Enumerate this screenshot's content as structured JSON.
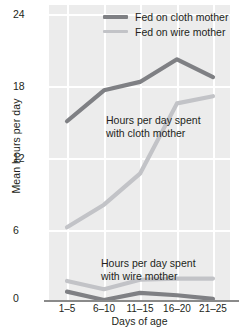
{
  "chart_data": {
    "type": "line",
    "title": "",
    "xlabel": "Days of age",
    "ylabel": "Mean hours per day",
    "categories": [
      "1–5",
      "6–10",
      "11–15",
      "16–20",
      "21–25"
    ],
    "ylim": [
      0,
      24
    ],
    "yticks": [
      0,
      6,
      12,
      18,
      24
    ],
    "ytick_labels": [
      "0",
      "6",
      "12",
      "18",
      "24"
    ],
    "grid": true,
    "legend_position": "top-right",
    "series": [
      {
        "name": "Fed on cloth mother",
        "measure": "hours per day spent with cloth mother",
        "color": "#7f8084",
        "values": [
          15.0,
          17.6,
          18.3,
          20.2,
          18.7
        ]
      },
      {
        "name": "Fed on wire mother",
        "measure": "hours per day spent with cloth mother",
        "color": "#c2c3c7",
        "values": [
          6.1,
          8.0,
          10.6,
          16.5,
          17.1
        ]
      },
      {
        "name": "Fed on cloth mother",
        "measure": "hours per day spent with wire mother",
        "color": "#7f8084",
        "values": [
          0.7,
          0.0,
          0.6,
          0.4,
          0.1
        ]
      },
      {
        "name": "Fed on wire mother",
        "measure": "hours per day spent with wire mother",
        "color": "#c2c3c7",
        "values": [
          1.6,
          0.9,
          1.7,
          1.8,
          1.8
        ]
      }
    ],
    "annotations": [
      {
        "text": "Hours per day spent\nwith cloth mother"
      },
      {
        "text": "Hours per day spent\nwith wire mother"
      }
    ]
  },
  "legend": {
    "items": [
      {
        "label": "Fed on cloth mother",
        "color": "#7f8084"
      },
      {
        "label": "Fed on wire mother",
        "color": "#c2c3c7"
      }
    ]
  },
  "colors": {
    "plot_background": "#ececec",
    "gridline": "#ffffff",
    "cloth_series": "#7f8084",
    "wire_series": "#c2c3c7",
    "text": "#231f20"
  }
}
